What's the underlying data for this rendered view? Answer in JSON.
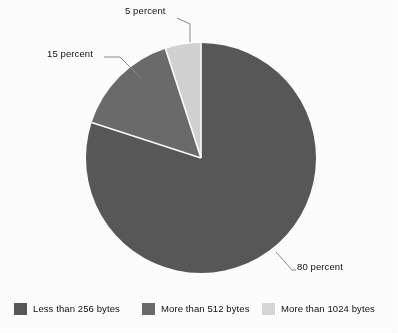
{
  "chart_data": {
    "type": "pie",
    "title": "",
    "subtitle": "",
    "xlabel": "",
    "ylabel": "",
    "grid": false,
    "legend_position": "bottom",
    "categories": [
      "Less than 256 bytes",
      "More than 512 bytes",
      "More than 1024 bytes"
    ],
    "values": [
      80,
      15,
      5
    ],
    "value_unit": "percent",
    "slices": [
      {
        "label": "Less than 256 bytes",
        "value": 80,
        "annotation": "80 percent",
        "color": "#585858",
        "start_angle_deg": 0,
        "end_angle_deg": 288
      },
      {
        "label": "More than 512 bytes",
        "value": 15,
        "annotation": "15 percent",
        "color": "#6b6b6b",
        "start_angle_deg": 288,
        "end_angle_deg": 342
      },
      {
        "label": "More than 1024 bytes",
        "value": 5,
        "annotation": "5 percent",
        "color": "#d3d3d3",
        "start_angle_deg": 342,
        "end_angle_deg": 360
      }
    ],
    "annotations": [
      {
        "text": "5 percent",
        "target_slice": "More than 1024 bytes"
      },
      {
        "text": "15 percent",
        "target_slice": "More than 512 bytes"
      },
      {
        "text": "80 percent",
        "target_slice": "Less than 256 bytes"
      }
    ]
  },
  "labels": {
    "five": "5 percent",
    "fifteen": "15 percent",
    "eighty": "80 percent"
  },
  "legend": {
    "items": [
      {
        "label": "Less than 256 bytes",
        "color": "#585858"
      },
      {
        "label": "More than 512 bytes",
        "color": "#6b6b6b"
      },
      {
        "label": "More than 1024 bytes",
        "color": "#d8d8d8"
      }
    ]
  },
  "colors": {
    "slice_large": "#585858",
    "slice_medium": "#6b6b6b",
    "slice_small": "#d3d3d3",
    "separator": "#ffffff",
    "leader_line": "#6f6f6f",
    "text": "#111111",
    "background": "#ffffff"
  }
}
